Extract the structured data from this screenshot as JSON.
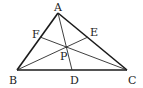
{
  "diagram": {
    "type": "triangle-cevians",
    "points": {
      "A": {
        "label": "A"
      },
      "B": {
        "label": "B"
      },
      "C": {
        "label": "C"
      },
      "D": {
        "label": "D"
      },
      "E": {
        "label": "E"
      },
      "F": {
        "label": "F"
      },
      "P": {
        "label": "P"
      }
    },
    "sides": [
      "AB",
      "BC",
      "CA"
    ],
    "cevians": [
      "AD",
      "BE",
      "CF"
    ],
    "intersection": "P"
  }
}
